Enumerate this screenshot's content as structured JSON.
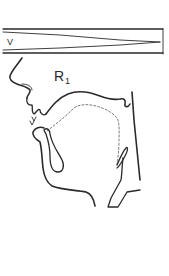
{
  "figure": {
    "type": "midsagittal vocal tract diagram",
    "velum_bar": {
      "label": "V",
      "description": "velic opening indicator (wedge narrowing to closure)"
    },
    "configuration_label": {
      "main": "R",
      "subscript": "1"
    },
    "parts": [
      "nose-profile",
      "upper-lip",
      "lower-lip",
      "teeth",
      "palate",
      "tongue-outline-dashed",
      "pharynx-wall",
      "jaw-line",
      "epiglottis",
      "larynx"
    ],
    "colors": {
      "ink": "#2a2a2a",
      "background": "#ffffff"
    }
  }
}
